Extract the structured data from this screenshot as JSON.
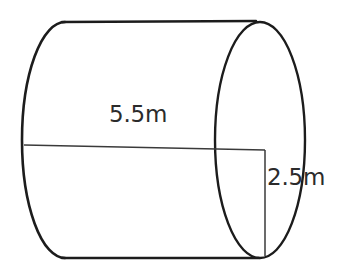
{
  "figure": {
    "name": "cylinder-diagram",
    "shape": "cylinder",
    "background_color": "#ffffff",
    "stroke_color": "#1c1c1c",
    "text_color": "#2b2b2b"
  },
  "labels": {
    "length": "5.5m",
    "radius": "2.5m"
  },
  "geometry": {
    "left_ellipse": {
      "cx": 65,
      "cy": 140,
      "rx": 43,
      "ry": 118
    },
    "right_ellipse": {
      "cx": 260,
      "cy": 140,
      "rx": 45,
      "ry": 118
    },
    "top_line": {
      "x1": 62,
      "y1": 22,
      "x2": 256,
      "y2": 21
    },
    "bottom_line": {
      "x1": 62,
      "y1": 258,
      "x2": 259,
      "y2": 258
    },
    "axis_line": {
      "x1": 24,
      "y1": 145,
      "x2": 265,
      "y2": 150
    },
    "radius_line": {
      "x1": 265,
      "y1": 150,
      "x2": 265,
      "y2": 256
    }
  }
}
